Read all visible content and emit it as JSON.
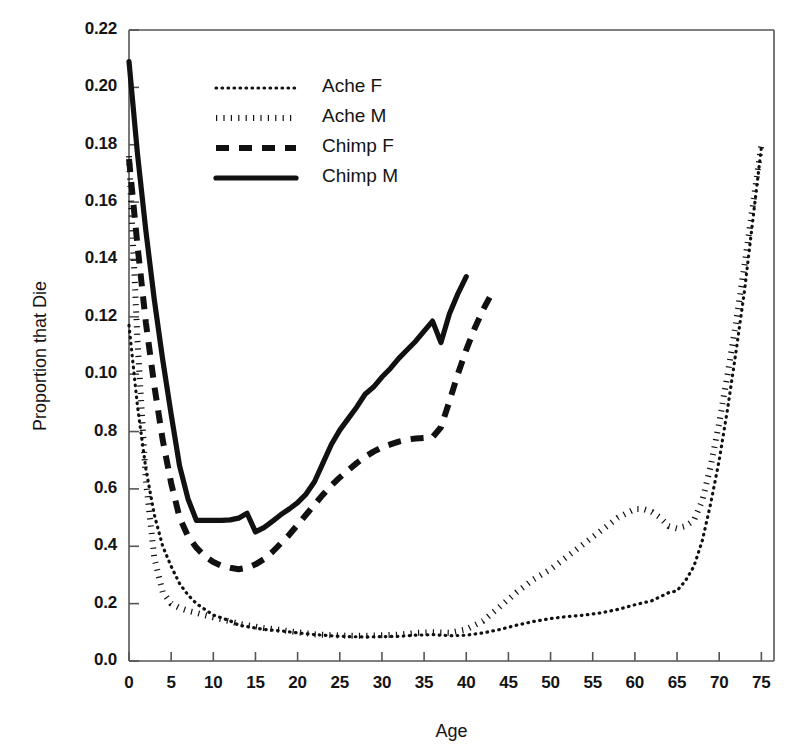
{
  "chart_data": {
    "type": "line",
    "title": "",
    "xlabel": "Age",
    "ylabel": "Proportion that Die",
    "xlim": [
      0,
      76.5
    ],
    "ylim": [
      0,
      0.22
    ],
    "grid": false,
    "legend_position": "top-left-inside",
    "xticks": [
      0,
      5,
      10,
      15,
      20,
      25,
      30,
      35,
      40,
      45,
      50,
      55,
      60,
      65,
      70,
      75
    ],
    "xtick_labels": [
      "0",
      "5",
      "10",
      "15",
      "20",
      "25",
      "30",
      "35",
      "40",
      "45",
      "50",
      "55",
      "60",
      "65",
      "70",
      "75"
    ],
    "yticks": [
      0.22,
      0.2,
      0.18,
      0.16,
      0.14,
      0.12,
      0.1,
      0.08,
      0.06,
      0.04,
      0.02,
      0.0
    ],
    "ytick_labels": [
      "0.22",
      "0.20",
      "0.18",
      "0.16",
      "0.14",
      "0.12",
      "0.10",
      "0.8",
      "0.6",
      "0.4",
      "0.2",
      "0.0"
    ],
    "series": [
      {
        "name": "Ache F",
        "style": "fine-dotted",
        "color": "#111111",
        "x": [
          0,
          1,
          2,
          3,
          4,
          5,
          6,
          7,
          8,
          9,
          10,
          11,
          12,
          13,
          14,
          15,
          16,
          18,
          20,
          22,
          24,
          26,
          28,
          30,
          32,
          34,
          36,
          38,
          40,
          42,
          44,
          46,
          48,
          50,
          52,
          54,
          56,
          58,
          60,
          62,
          64,
          65,
          66,
          67,
          68,
          69,
          70,
          71,
          72,
          73,
          74,
          75
        ],
        "y": [
          0.117,
          0.089,
          0.067,
          0.051,
          0.04,
          0.033,
          0.027,
          0.023,
          0.02,
          0.018,
          0.016,
          0.015,
          0.014,
          0.0125,
          0.012,
          0.0115,
          0.011,
          0.0105,
          0.0098,
          0.0092,
          0.0088,
          0.0085,
          0.0084,
          0.0085,
          0.0086,
          0.009,
          0.0092,
          0.0088,
          0.009,
          0.0098,
          0.011,
          0.0125,
          0.0138,
          0.0148,
          0.0155,
          0.016,
          0.0168,
          0.018,
          0.0196,
          0.021,
          0.0238,
          0.0245,
          0.028,
          0.033,
          0.042,
          0.055,
          0.07,
          0.088,
          0.108,
          0.129,
          0.154,
          0.179
        ]
      },
      {
        "name": "Ache M",
        "style": "thick-dotted",
        "color": "#111111",
        "x": [
          0,
          1,
          2,
          3,
          4,
          5,
          6,
          7,
          8,
          9,
          10,
          11,
          12,
          13,
          14,
          15,
          16,
          18,
          20,
          22,
          24,
          26,
          28,
          30,
          32,
          34,
          36,
          38,
          40,
          42,
          44,
          46,
          48,
          50,
          52,
          54,
          56,
          58,
          60,
          61,
          62,
          63,
          64,
          65,
          66,
          67,
          68,
          69,
          70,
          71,
          72,
          73,
          74,
          75
        ],
        "y": [
          0.176,
          0.112,
          0.063,
          0.036,
          0.024,
          0.02,
          0.0185,
          0.0175,
          0.0168,
          0.016,
          0.0152,
          0.0145,
          0.0138,
          0.013,
          0.0125,
          0.012,
          0.0115,
          0.0108,
          0.01,
          0.0093,
          0.009,
          0.0088,
          0.0088,
          0.009,
          0.0092,
          0.0098,
          0.01,
          0.0098,
          0.011,
          0.014,
          0.019,
          0.024,
          0.0285,
          0.032,
          0.0365,
          0.041,
          0.0455,
          0.05,
          0.053,
          0.053,
          0.052,
          0.05,
          0.047,
          0.0462,
          0.047,
          0.049,
          0.056,
          0.068,
          0.083,
          0.1,
          0.118,
          0.138,
          0.159,
          0.18
        ]
      },
      {
        "name": "Chimp F",
        "style": "dashed",
        "color": "#111111",
        "x": [
          0,
          1,
          2,
          3,
          4,
          5,
          6,
          7,
          8,
          9,
          10,
          11,
          12,
          13,
          14,
          15,
          16,
          17,
          18,
          19,
          20,
          21,
          22,
          23,
          24,
          25,
          26,
          27,
          28,
          29,
          30,
          31,
          32,
          33,
          34,
          35,
          36,
          37,
          38,
          39,
          40,
          41,
          42,
          43
        ],
        "y": [
          0.175,
          0.145,
          0.118,
          0.096,
          0.077,
          0.062,
          0.05,
          0.0435,
          0.0395,
          0.0365,
          0.0345,
          0.0332,
          0.0325,
          0.032,
          0.0325,
          0.0337,
          0.0355,
          0.038,
          0.041,
          0.044,
          0.0475,
          0.051,
          0.0545,
          0.058,
          0.0612,
          0.064,
          0.0665,
          0.069,
          0.0712,
          0.073,
          0.0745,
          0.0755,
          0.0765,
          0.0772,
          0.0776,
          0.0778,
          0.078,
          0.0815,
          0.0905,
          0.1,
          0.1085,
          0.116,
          0.1225,
          0.128
        ]
      },
      {
        "name": "Chimp M",
        "style": "solid",
        "color": "#111111",
        "x": [
          0,
          1,
          2,
          3,
          4,
          5,
          6,
          7,
          8,
          9,
          10,
          11,
          12,
          13,
          14,
          15,
          16,
          17,
          18,
          19,
          20,
          21,
          22,
          23,
          24,
          25,
          26,
          27,
          28,
          29,
          30,
          31,
          32,
          33,
          34,
          35,
          36,
          37,
          38,
          39,
          40
        ],
        "y": [
          0.209,
          0.177,
          0.15,
          0.126,
          0.105,
          0.086,
          0.068,
          0.0565,
          0.049,
          0.049,
          0.049,
          0.049,
          0.0492,
          0.0498,
          0.0515,
          0.045,
          0.0465,
          0.0487,
          0.051,
          0.053,
          0.0552,
          0.0582,
          0.0625,
          0.069,
          0.0755,
          0.0805,
          0.0845,
          0.0885,
          0.093,
          0.0955,
          0.099,
          0.102,
          0.1055,
          0.1085,
          0.1115,
          0.115,
          0.1185,
          0.111,
          0.121,
          0.128,
          0.134
        ]
      }
    ]
  },
  "legend": {
    "entries": [
      {
        "label": "Ache F",
        "style": "fine-dotted"
      },
      {
        "label": "Ache M",
        "style": "thick-dotted"
      },
      {
        "label": "Chimp F",
        "style": "dashed"
      },
      {
        "label": "Chimp M",
        "style": "solid"
      }
    ]
  },
  "axes": {
    "x_title": "Age",
    "y_title": "Proportion that Die"
  }
}
